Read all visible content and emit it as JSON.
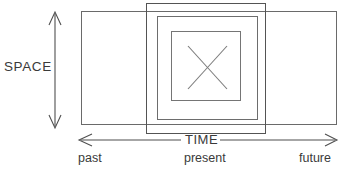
{
  "diagram": {
    "background_color": "#ffffff",
    "line_color": "#5b5b5b",
    "axes": {
      "vertical": {
        "label": "SPACE",
        "icon": "double-headed-vertical-arrow-icon",
        "x": 55,
        "y_top": 12,
        "y_bottom": 128
      },
      "horizontal": {
        "label": "TIME",
        "icon": "double-headed-horizontal-arrow-icon",
        "y": 140,
        "x_left": 79,
        "x_right": 337,
        "tick_labels": {
          "left": "past",
          "center": "present",
          "right": "future"
        }
      }
    },
    "rectangles": [
      {
        "name": "outer-wide-rectangle",
        "x": 81,
        "y": 11,
        "width": 255,
        "height": 113
      },
      {
        "name": "tall-rectangle",
        "x": 146,
        "y": 3,
        "width": 120,
        "height": 130
      },
      {
        "name": "middle-rectangle",
        "x": 157,
        "y": 16,
        "width": 101,
        "height": 103
      },
      {
        "name": "inner-square",
        "x": 171,
        "y": 31,
        "width": 69,
        "height": 69
      }
    ],
    "cross": {
      "name": "x-mark",
      "x1": 188,
      "y1": 46,
      "x2": 227,
      "y2": 89,
      "center_x": 206,
      "center_y": 67
    }
  }
}
